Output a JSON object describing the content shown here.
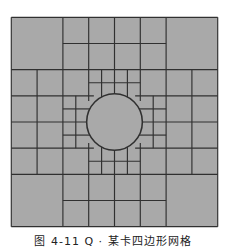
{
  "figure": {
    "caption": "图 4-11  Q · 某卡四边形网格",
    "colors": {
      "background": "#ffffff",
      "fill": "#a9a9a9",
      "line": "#303030"
    },
    "grid": {
      "size": 8,
      "verticals": [
        {
          "x": 0,
          "from": 0,
          "to": 8
        },
        {
          "x": 8,
          "from": 0,
          "to": 8
        },
        {
          "x": 1,
          "from": 2,
          "to": 6
        },
        {
          "x": 7,
          "from": 2,
          "to": 6
        },
        {
          "x": 2,
          "from": 0,
          "to": 8
        },
        {
          "x": 6,
          "from": 0,
          "to": 8
        },
        {
          "x": 2.5,
          "from": 3,
          "to": 5
        },
        {
          "x": 5.5,
          "from": 3,
          "to": 5
        },
        {
          "x": 3,
          "from": 0,
          "to": 3.2
        },
        {
          "x": 3,
          "from": 4.8,
          "to": 8
        },
        {
          "x": 5,
          "from": 0,
          "to": 3.2
        },
        {
          "x": 5,
          "from": 4.8,
          "to": 8
        },
        {
          "x": 4,
          "from": 0,
          "to": 3
        },
        {
          "x": 4,
          "from": 5,
          "to": 8
        },
        {
          "x": 3.5,
          "from": 2,
          "to": 3.05
        },
        {
          "x": 3.5,
          "from": 4.95,
          "to": 6
        },
        {
          "x": 4.5,
          "from": 2,
          "to": 3.05
        },
        {
          "x": 4.5,
          "from": 4.95,
          "to": 6
        }
      ],
      "horizontals": [
        {
          "y": 0,
          "from": 0,
          "to": 8
        },
        {
          "y": 8,
          "from": 0,
          "to": 8
        },
        {
          "y": 1,
          "from": 2,
          "to": 6
        },
        {
          "y": 7,
          "from": 2,
          "to": 6
        },
        {
          "y": 2,
          "from": 0,
          "to": 8
        },
        {
          "y": 6,
          "from": 0,
          "to": 8
        },
        {
          "y": 2.5,
          "from": 3,
          "to": 5
        },
        {
          "y": 5.5,
          "from": 3,
          "to": 5
        },
        {
          "y": 3,
          "from": 0,
          "to": 3.2
        },
        {
          "y": 3,
          "from": 4.8,
          "to": 8
        },
        {
          "y": 5,
          "from": 0,
          "to": 3.2
        },
        {
          "y": 5,
          "from": 4.8,
          "to": 8
        },
        {
          "y": 4,
          "from": 0,
          "to": 3
        },
        {
          "y": 4,
          "from": 5,
          "to": 8
        },
        {
          "y": 3.5,
          "from": 2,
          "to": 3.05
        },
        {
          "y": 3.5,
          "from": 4.95,
          "to": 6
        },
        {
          "y": 4.5,
          "from": 2,
          "to": 3.05
        },
        {
          "y": 4.5,
          "from": 4.95,
          "to": 6
        }
      ],
      "circle": {
        "cx": 4,
        "cy": 4,
        "r": 1.08
      }
    }
  }
}
